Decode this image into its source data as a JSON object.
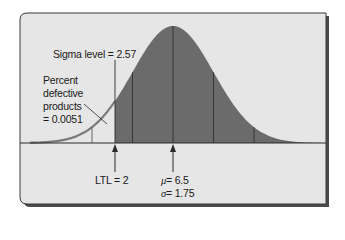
{
  "figure": {
    "type": "normal-distribution-diagram",
    "colors": {
      "background": "#e6e6e6",
      "frame": "#3a3a3a",
      "shaded_area": "#6b6b6b",
      "tail_curve": "#7a7a7a",
      "lines": "#2a2a2a",
      "text": "#1a1a1a"
    }
  },
  "labels": {
    "sigma_level": "Sigma level = 2.57",
    "defective_line1": "Percent",
    "defective_line2": "defective",
    "defective_line3": "products",
    "defective_line4": "= 0.0051",
    "ltl": "LTL = 2",
    "mu_symbol": "μ",
    "mu_value": "= 6.5",
    "sigma_symbol": "σ",
    "sigma_value": "= 1.75"
  },
  "chart_data": {
    "type": "area",
    "title": "",
    "distribution": "normal",
    "mean": 6.5,
    "std_dev": 1.75,
    "lower_tolerance_limit": 2,
    "sigma_level": 2.57,
    "percent_defective": 0.0051,
    "shaded_region": "x >= LTL",
    "unshaded_tail": "x < LTL (defective)",
    "reference_lines_at_sigma": [
      -2,
      -1,
      0,
      1,
      2
    ],
    "annotations": [
      "Sigma level = 2.57",
      "Percent defective products = 0.0051",
      "LTL = 2",
      "μ = 6.5",
      "σ = 1.75"
    ],
    "grid": false,
    "legend": "none"
  }
}
